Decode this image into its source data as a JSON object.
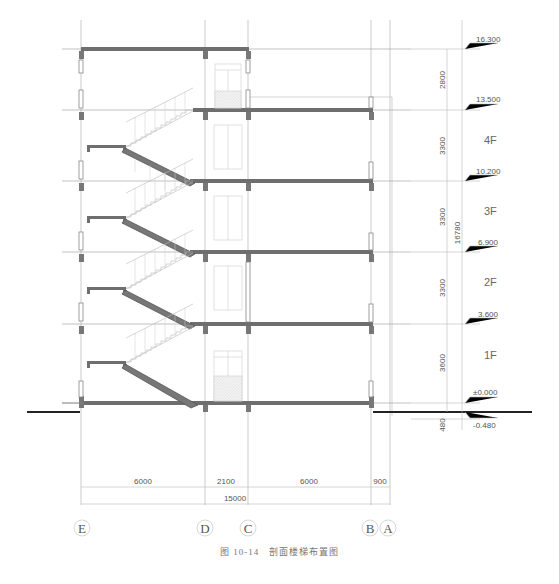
{
  "figure": {
    "caption_number": "图 10-14",
    "caption_title": "剖面楼梯布置图"
  },
  "axes": [
    {
      "label": "E",
      "x": 81
    },
    {
      "label": "D",
      "x": 205
    },
    {
      "label": "C",
      "x": 248
    },
    {
      "label": "B",
      "x": 371
    },
    {
      "label": "A",
      "x": 390
    }
  ],
  "horizontal_dimensions": {
    "segments": [
      "6000",
      "2100",
      "6000",
      "900"
    ],
    "total": "15000"
  },
  "vertical_dimensions": {
    "segments": [
      "2800",
      "3300",
      "3300",
      "3300",
      "3600",
      "480"
    ],
    "total": "16780"
  },
  "levels": [
    {
      "elevation": "16.300",
      "y": 49
    },
    {
      "elevation": "13.500",
      "y": 110
    },
    {
      "elevation": "10.200",
      "y": 181
    },
    {
      "elevation": "6.900",
      "y": 252
    },
    {
      "elevation": "3.600",
      "y": 324
    },
    {
      "elevation": "±0.000",
      "y": 403
    },
    {
      "elevation": "-0.480",
      "y": 412
    }
  ],
  "floors": [
    "4F",
    "3F",
    "2F",
    "1F"
  ]
}
